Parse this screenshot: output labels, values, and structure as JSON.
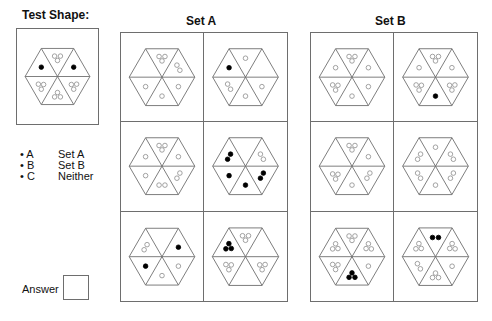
{
  "test_shape": {
    "title": "Test Shape:",
    "triangles": [
      [
        "o",
        "o",
        "o"
      ],
      [
        "f"
      ],
      [
        "o",
        "o",
        "o"
      ],
      [
        "o",
        "o",
        "o"
      ],
      [
        "o",
        "o",
        "o"
      ],
      [
        "f"
      ]
    ]
  },
  "set_a": {
    "title": "Set A",
    "cells": [
      [
        [
          "o",
          "o",
          "o"
        ],
        [
          "o",
          "o"
        ],
        [
          "o"
        ],
        [
          "o"
        ],
        [
          "o"
        ],
        []
      ],
      [
        [
          "o"
        ],
        [],
        [
          "o"
        ],
        [
          "o"
        ],
        [
          "o",
          "o"
        ],
        [
          "f"
        ]
      ],
      [
        [
          "o",
          "o",
          "o"
        ],
        [
          "o"
        ],
        [
          "o",
          "o"
        ],
        [
          "o",
          "o"
        ],
        [
          "o"
        ],
        [
          "o"
        ]
      ],
      [
        [],
        [
          "o",
          "o"
        ],
        [
          "f",
          "f"
        ],
        [
          "f"
        ],
        [
          "f"
        ],
        [
          "f",
          "f"
        ]
      ],
      [
        [],
        [
          "f"
        ],
        [
          "o"
        ],
        [
          "o"
        ],
        [
          "f"
        ],
        [
          "o",
          "o"
        ]
      ],
      [
        [
          "o",
          "o",
          "o"
        ],
        [],
        [
          "o",
          "o",
          "o"
        ],
        [],
        [
          "o",
          "o",
          "o"
        ],
        [
          "f",
          "f",
          "f"
        ]
      ]
    ]
  },
  "set_b": {
    "title": "Set B",
    "cells": [
      [
        [
          "o",
          "o",
          "o"
        ],
        [
          "o"
        ],
        [
          "o"
        ],
        [
          "o"
        ],
        [
          "o",
          "o",
          "o"
        ],
        [
          "o"
        ]
      ],
      [
        [
          "o",
          "o",
          "o"
        ],
        [
          "o"
        ],
        [
          "o",
          "o",
          "o"
        ],
        [
          "f"
        ],
        [
          "o",
          "o",
          "o"
        ],
        [
          "o"
        ]
      ],
      [
        [
          "o",
          "o",
          "o"
        ],
        [
          "o"
        ],
        [
          "o",
          "o"
        ],
        [
          "o"
        ],
        [
          "o",
          "o",
          "o"
        ],
        []
      ],
      [
        [
          "o"
        ],
        [
          "o",
          "o"
        ],
        [
          "o",
          "o"
        ],
        [
          "o"
        ],
        [
          "o",
          "o"
        ],
        [
          "o",
          "o"
        ]
      ],
      [
        [
          "o",
          "o",
          "o"
        ],
        [
          "o",
          "o",
          "o"
        ],
        [
          "o"
        ],
        [
          "f",
          "f",
          "f"
        ],
        [
          "o",
          "o",
          "o"
        ],
        [
          "o",
          "o",
          "o"
        ]
      ],
      [
        [
          "f",
          "f"
        ],
        [
          "o",
          "o",
          "o"
        ],
        [
          "o"
        ],
        [
          "o",
          "o",
          "o"
        ],
        [
          "o",
          "o"
        ],
        [
          "o",
          "o",
          "o"
        ]
      ]
    ]
  },
  "legend": {
    "items": [
      {
        "key": "• A",
        "label": "Set A"
      },
      {
        "key": "• B",
        "label": "Set B"
      },
      {
        "key": "• C",
        "label": "Neither"
      }
    ]
  },
  "answer": {
    "label": "Answer",
    "value": ""
  },
  "colors": {
    "line": "#6e6e6e",
    "filled": "#000000",
    "open": "#8a8a8a"
  }
}
